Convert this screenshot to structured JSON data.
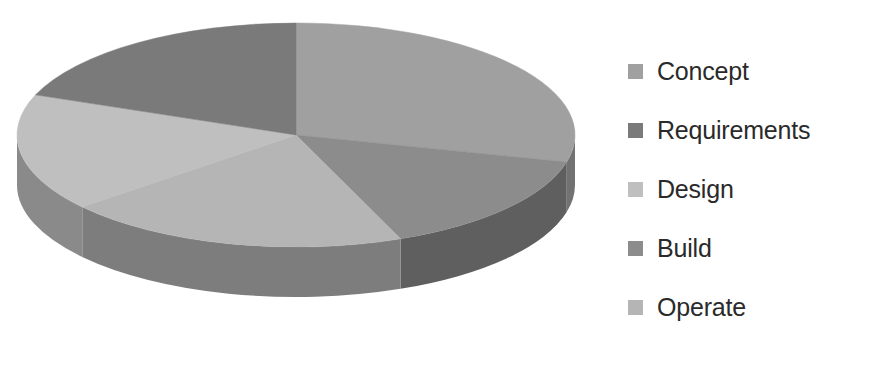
{
  "chart_data": {
    "type": "pie",
    "title": "",
    "three_d": true,
    "legend_position": "right",
    "categories": [
      "Concept",
      "Requirements",
      "Design",
      "Build",
      "Operate"
    ],
    "values": [
      29,
      19,
      17,
      15,
      20
    ],
    "units": "percent",
    "colors": [
      "#a0a0a0",
      "#7a7a7a",
      "#bfbfbf",
      "#8c8c8c",
      "#b5b5b5"
    ],
    "slices": [
      {
        "label": "Concept",
        "value": 29,
        "color": "#a0a0a0",
        "side_color": "#727272",
        "start_deg": 0,
        "end_deg": 104
      },
      {
        "label": "Build",
        "value": 15,
        "color": "#8c8c8c",
        "side_color": "#5f5f5f",
        "start_deg": 104,
        "end_deg": 158
      },
      {
        "label": "Operate",
        "value": 20,
        "color": "#b5b5b5",
        "side_color": "#7d7d7d",
        "start_deg": 158,
        "end_deg": 230
      },
      {
        "label": "Design",
        "value": 17,
        "color": "#bfbfbf",
        "side_color": "#8a8a8a",
        "start_deg": 230,
        "end_deg": 291
      },
      {
        "label": "Requirements",
        "value": 19,
        "color": "#7a7a7a",
        "side_color": "#565656",
        "start_deg": 291,
        "end_deg": 360
      }
    ],
    "geometry": {
      "cx": 296,
      "cy": 135,
      "rx": 279,
      "ry": 112,
      "depth": 50
    }
  },
  "legend": {
    "items": [
      {
        "label": "Concept",
        "color": "#a0a0a0"
      },
      {
        "label": "Requirements",
        "color": "#7a7a7a"
      },
      {
        "label": "Design",
        "color": "#bfbfbf"
      },
      {
        "label": "Build",
        "color": "#8c8c8c"
      },
      {
        "label": "Operate",
        "color": "#b5b5b5"
      }
    ]
  }
}
